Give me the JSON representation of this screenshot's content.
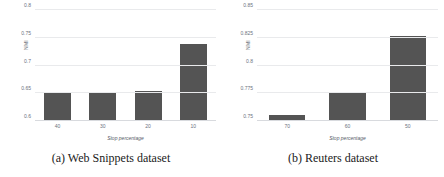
{
  "figure": {
    "panels": [
      {
        "caption": "(a) Web Snippets dataset",
        "chart_data": {
          "type": "bar",
          "title": "",
          "categories": [
            "40",
            "30",
            "20",
            "10"
          ],
          "values": [
            0.652,
            0.652,
            0.654,
            0.739
          ],
          "xlabel": "Stop percentage",
          "ylabel": "NMI",
          "ylim": [
            0.6,
            0.8
          ],
          "yticks": [
            "0.6",
            "0.65",
            "0.7",
            "0.75",
            "0.8"
          ],
          "ytick_values": [
            0.6,
            0.65,
            0.7,
            0.75,
            0.8
          ],
          "grid": true,
          "legend": "none",
          "bar_color": "#545454"
        }
      },
      {
        "caption": "(b) Reuters dataset",
        "chart_data": {
          "type": "bar",
          "title": "",
          "categories": [
            "70",
            "60",
            "50"
          ],
          "values": [
            0.7555,
            0.775,
            0.827
          ],
          "xlabel": "Stop percentage",
          "ylabel": "NMI",
          "ylim": [
            0.75,
            0.85
          ],
          "yticks": [
            "0.75",
            "0.775",
            "0.8",
            "0.825",
            "0.85"
          ],
          "ytick_values": [
            0.75,
            0.775,
            0.8,
            0.825,
            0.85
          ],
          "grid": true,
          "legend": "none",
          "bar_color": "#545454"
        }
      }
    ]
  }
}
